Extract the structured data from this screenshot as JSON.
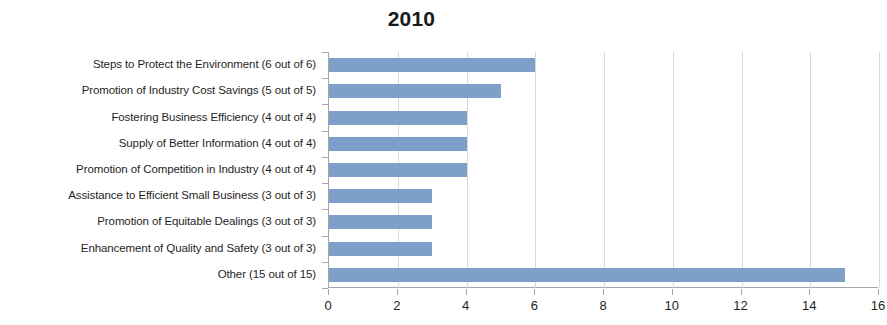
{
  "chart_data": {
    "type": "bar",
    "orientation": "horizontal",
    "title": "2010",
    "xlabel": "",
    "ylabel": "",
    "xlim": [
      0,
      16
    ],
    "xticks": [
      0,
      2,
      4,
      6,
      8,
      10,
      12,
      14,
      16
    ],
    "xtick_labels": [
      "0",
      "2",
      "4",
      "6",
      "8",
      "10",
      "12",
      "14",
      "16"
    ],
    "grid": "vertical",
    "legend": "none",
    "bar_color": "#7f9fcb",
    "gridline_color": "#d9d9d9",
    "axis_color": "#a6a6a6",
    "categories": [
      "Steps to Protect the Environment (6 out of 6)",
      "Promotion of Industry Cost Savings (5 out of 5)",
      "Fostering Business Efficiency  (4 out of 4)",
      "Supply of Better Information (4 out of 4)",
      "Promotion of Competition in Industry (4 out of 4)",
      "Assistance to Efficient Small Business (3 out of 3)",
      "Promotion of Equitable Dealings  (3 out of 3)",
      "Enhancement of Quality and Safety (3 out of 3)",
      "Other (15 out of 15)"
    ],
    "values": [
      6,
      5,
      4,
      4,
      4,
      3,
      3,
      3,
      15
    ]
  }
}
